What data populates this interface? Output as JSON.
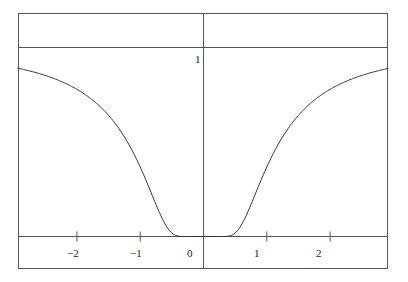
{
  "chart_data": {
    "type": "line",
    "title": "",
    "xlabel": "",
    "ylabel": "",
    "function": "exp(-1/x^2)",
    "xlim": [
      -2.94,
      2.92
    ],
    "ylim": [
      -0.17,
      1.18
    ],
    "grid": false,
    "legend": null,
    "x_ticks": [
      -2,
      -1,
      1,
      2
    ],
    "x_tick_labels": [
      "−2",
      "−1",
      "0",
      "1",
      "2"
    ],
    "y_ticks": [
      1
    ],
    "y_tick_labels": [
      "1"
    ],
    "reference_lines": [
      {
        "orientation": "horizontal",
        "y": 1
      },
      {
        "orientation": "horizontal",
        "y": 0
      },
      {
        "orientation": "vertical",
        "x": 0
      }
    ],
    "series": [
      {
        "name": "f(x)",
        "x": [
          -2.94,
          -2.5,
          -2.0,
          -1.5,
          -1.25,
          -1.0,
          -0.75,
          -0.5,
          -0.35,
          -0.25,
          0.0,
          0.25,
          0.35,
          0.5,
          0.75,
          1.0,
          1.25,
          1.5,
          2.0,
          2.5,
          2.92
        ],
        "values": [
          0.891,
          0.852,
          0.779,
          0.641,
          0.527,
          0.368,
          0.169,
          0.018,
          0.0003,
          0.0,
          0.0,
          0.0,
          0.0003,
          0.018,
          0.169,
          0.368,
          0.527,
          0.641,
          0.779,
          0.852,
          0.889
        ]
      }
    ]
  },
  "labels": {
    "x_minus2": "−2",
    "x_minus1": "−1",
    "x_zero": "0",
    "x_one": "1",
    "x_two": "2",
    "y_one": "1"
  }
}
